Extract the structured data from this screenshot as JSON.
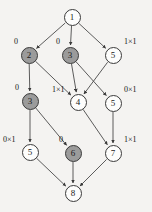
{
  "diagram": {
    "background_color": "#f4f3f1",
    "node_fill_plain": "#fdfdfc",
    "node_fill_shaded": "#9b9b9b",
    "stroke_color": "#3a3a3a",
    "nodes": [
      {
        "id": "n1",
        "label": "1",
        "shaded": false,
        "x": 72,
        "y": 17
      },
      {
        "id": "n2",
        "label": "2",
        "shaded": true,
        "x": 29,
        "y": 55
      },
      {
        "id": "n3a",
        "label": "3",
        "shaded": true,
        "x": 70,
        "y": 55
      },
      {
        "id": "n5a",
        "label": "5",
        "shaded": false,
        "x": 113,
        "y": 55
      },
      {
        "id": "n3b",
        "label": "3",
        "shaded": true,
        "x": 30,
        "y": 101
      },
      {
        "id": "n4",
        "label": "4",
        "shaded": false,
        "x": 78,
        "y": 102
      },
      {
        "id": "n5b",
        "label": "5",
        "shaded": false,
        "x": 113,
        "y": 103
      },
      {
        "id": "n5c",
        "label": "5",
        "shaded": false,
        "x": 30,
        "y": 152
      },
      {
        "id": "n6",
        "label": "6",
        "shaded": true,
        "x": 73,
        "y": 153
      },
      {
        "id": "n7",
        "label": "7",
        "shaded": false,
        "x": 113,
        "y": 153
      },
      {
        "id": "n8",
        "label": "8",
        "shaded": false,
        "x": 73,
        "y": 193
      }
    ],
    "edges": [
      {
        "from": "n1",
        "to": "n2"
      },
      {
        "from": "n1",
        "to": "n3a"
      },
      {
        "from": "n1",
        "to": "n5a"
      },
      {
        "from": "n2",
        "to": "n3b"
      },
      {
        "from": "n2",
        "to": "n4"
      },
      {
        "from": "n3a",
        "to": "n4"
      },
      {
        "from": "n3a",
        "to": "n5b"
      },
      {
        "from": "n5a",
        "to": "n4"
      },
      {
        "from": "n3b",
        "to": "n5c"
      },
      {
        "from": "n3b",
        "to": "n6"
      },
      {
        "from": "n4",
        "to": "n7"
      },
      {
        "from": "n5b",
        "to": "n7"
      },
      {
        "from": "n5c",
        "to": "n8"
      },
      {
        "from": "n6",
        "to": "n8"
      },
      {
        "from": "n7",
        "to": "n8"
      }
    ],
    "edge_labels": [
      {
        "id": "lbl-n2",
        "text": "0",
        "x": 14,
        "y": 38
      },
      {
        "id": "lbl-n3a",
        "text": "0",
        "x": 56,
        "y": 38
      },
      {
        "id": "lbl-n5a",
        "text": "1×1",
        "x": 124,
        "y": 38
      },
      {
        "id": "lbl-n3b",
        "text": "0",
        "x": 15,
        "y": 84
      },
      {
        "id": "lbl-n4",
        "text": "1×1",
        "x": 52,
        "y": 86
      },
      {
        "id": "lbl-n5b",
        "text": "0×1",
        "x": 124,
        "y": 86
      },
      {
        "id": "lbl-n5c",
        "text": "0×1",
        "x": 3,
        "y": 136
      },
      {
        "id": "lbl-n6",
        "text": "0",
        "x": 59,
        "y": 136
      },
      {
        "id": "lbl-n7",
        "text": "1×1",
        "x": 124,
        "y": 136
      }
    ]
  }
}
